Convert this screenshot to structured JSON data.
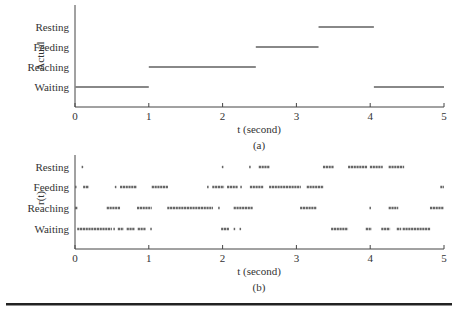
{
  "chart_data": [
    {
      "type": "line",
      "subtype": "step-segments",
      "panel_label": "(a)",
      "xlabel": "t (second)",
      "ylabel": "Actual",
      "xlim": [
        0,
        5
      ],
      "xticks": [
        "0",
        "1",
        "2",
        "3",
        "4",
        "5"
      ],
      "categories": [
        "Waiting",
        "Reaching",
        "Feeding",
        "Resting"
      ],
      "segments": [
        {
          "state": "Waiting",
          "start": 0.0,
          "end": 1.0
        },
        {
          "state": "Reaching",
          "start": 1.0,
          "end": 2.45
        },
        {
          "state": "Feeding",
          "start": 2.45,
          "end": 3.3
        },
        {
          "state": "Resting",
          "start": 3.3,
          "end": 4.05
        },
        {
          "state": "Waiting",
          "start": 4.05,
          "end": 5.0
        }
      ],
      "grid": false,
      "color": "#888888"
    },
    {
      "type": "scatter",
      "subtype": "dotted-segments",
      "panel_label": "(b)",
      "xlabel": "t (second)",
      "ylabel": "r(t)",
      "xlim": [
        0,
        5
      ],
      "xticks": [
        "0",
        "1",
        "2",
        "3",
        "4",
        "5"
      ],
      "categories": [
        "Waiting",
        "Reaching",
        "Feeding",
        "Resting"
      ],
      "segments": [
        {
          "state": "Resting",
          "start": 0.09,
          "end": 0.11
        },
        {
          "state": "Resting",
          "start": 1.99,
          "end": 2.01
        },
        {
          "state": "Resting",
          "start": 2.36,
          "end": 2.38
        },
        {
          "state": "Resting",
          "start": 2.49,
          "end": 2.64
        },
        {
          "state": "Resting",
          "start": 3.36,
          "end": 3.51
        },
        {
          "state": "Resting",
          "start": 3.7,
          "end": 3.96
        },
        {
          "state": "Resting",
          "start": 3.996,
          "end": 4.17
        },
        {
          "state": "Resting",
          "start": 4.25,
          "end": 4.46
        },
        {
          "state": "Feeding",
          "start": 0.0,
          "end": 0.02
        },
        {
          "state": "Feeding",
          "start": 0.11,
          "end": 0.19
        },
        {
          "state": "Feeding",
          "start": 0.54,
          "end": 0.56
        },
        {
          "state": "Feeding",
          "start": 0.61,
          "end": 0.84
        },
        {
          "state": "Feeding",
          "start": 1.04,
          "end": 1.26
        },
        {
          "state": "Feeding",
          "start": 1.79,
          "end": 1.81
        },
        {
          "state": "Feeding",
          "start": 1.86,
          "end": 2.02
        },
        {
          "state": "Feeding",
          "start": 2.06,
          "end": 2.21
        },
        {
          "state": "Feeding",
          "start": 2.24,
          "end": 2.26
        },
        {
          "state": "Feeding",
          "start": 2.37,
          "end": 2.55
        },
        {
          "state": "Feeding",
          "start": 2.63,
          "end": 3.06
        },
        {
          "state": "Feeding",
          "start": 3.14,
          "end": 3.37
        },
        {
          "state": "Feeding",
          "start": 4.95,
          "end": 5.0
        },
        {
          "state": "Reaching",
          "start": 0.0,
          "end": 0.04
        },
        {
          "state": "Reaching",
          "start": 0.43,
          "end": 0.61
        },
        {
          "state": "Reaching",
          "start": 0.84,
          "end": 1.04
        },
        {
          "state": "Reaching",
          "start": 1.25,
          "end": 1.87
        },
        {
          "state": "Reaching",
          "start": 1.94,
          "end": 1.96
        },
        {
          "state": "Reaching",
          "start": 2.15,
          "end": 2.41
        },
        {
          "state": "Reaching",
          "start": 3.05,
          "end": 3.27
        },
        {
          "state": "Reaching",
          "start": 3.99,
          "end": 4.01
        },
        {
          "state": "Reaching",
          "start": 4.25,
          "end": 4.38
        },
        {
          "state": "Reaching",
          "start": 4.81,
          "end": 5.0
        },
        {
          "state": "Waiting",
          "start": 0.03,
          "end": 0.5
        },
        {
          "state": "Waiting",
          "start": 0.52,
          "end": 0.54
        },
        {
          "state": "Waiting",
          "start": 0.58,
          "end": 0.66
        },
        {
          "state": "Waiting",
          "start": 0.7,
          "end": 0.81
        },
        {
          "state": "Waiting",
          "start": 0.85,
          "end": 0.96
        },
        {
          "state": "Waiting",
          "start": 1.02,
          "end": 1.04
        },
        {
          "state": "Waiting",
          "start": 1.98,
          "end": 2.09
        },
        {
          "state": "Waiting",
          "start": 2.15,
          "end": 2.17
        },
        {
          "state": "Waiting",
          "start": 2.23,
          "end": 2.25
        },
        {
          "state": "Waiting",
          "start": 3.47,
          "end": 3.7
        },
        {
          "state": "Waiting",
          "start": 3.94,
          "end": 4.02
        },
        {
          "state": "Waiting",
          "start": 4.15,
          "end": 4.27
        },
        {
          "state": "Waiting",
          "start": 4.36,
          "end": 4.42
        },
        {
          "state": "Waiting",
          "start": 4.44,
          "end": 4.82
        }
      ],
      "grid": false,
      "color": "#666666"
    }
  ]
}
